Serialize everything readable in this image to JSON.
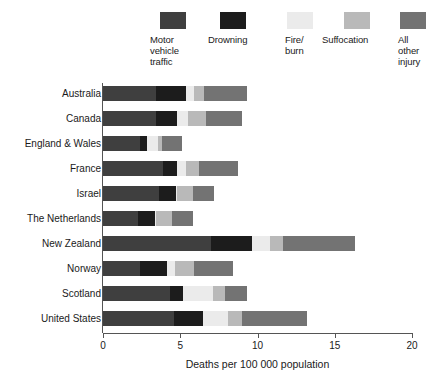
{
  "chart_data": {
    "type": "bar",
    "orientation": "horizontal",
    "stacked": true,
    "title": "",
    "xlabel": "Deaths per 100 000 population",
    "ylabel": "",
    "xlim": [
      0,
      20
    ],
    "xticks": [
      0,
      5,
      10,
      15,
      20
    ],
    "xtick_labels": [
      "0",
      "5",
      "10",
      "15",
      "20"
    ],
    "grid": false,
    "legend_position": "top",
    "categories": [
      "Australia",
      "Canada",
      "England & Wales",
      "France",
      "Israel",
      "The Netherlands",
      "New Zealand",
      "Norway",
      "Scotland",
      "United States"
    ],
    "series": [
      {
        "name": "Motor\nvehicle\ntraffic",
        "name_plain": "Motor vehicle traffic",
        "color": "#3f3f3f",
        "values": [
          3.4,
          3.4,
          2.4,
          3.9,
          3.6,
          2.25,
          7.0,
          2.4,
          4.35,
          4.6
        ]
      },
      {
        "name": "Drowning",
        "name_plain": "Drowning",
        "color": "#1c1c1c",
        "values": [
          2.0,
          1.4,
          0.45,
          0.9,
          1.1,
          1.1,
          2.65,
          1.75,
          0.85,
          1.9
        ]
      },
      {
        "name": "Fire/\nburn",
        "name_plain": "Fire/burn",
        "color": "#ebebeb",
        "values": [
          0.5,
          0.7,
          0.7,
          0.55,
          0.1,
          0.1,
          1.15,
          0.5,
          1.95,
          1.6
        ]
      },
      {
        "name": "Suffocation",
        "name_plain": "Suffocation",
        "color": "#b9b9b9",
        "values": [
          0.65,
          1.2,
          0.3,
          0.85,
          1.0,
          1.0,
          0.85,
          1.25,
          0.75,
          0.9
        ]
      },
      {
        "name": "All\nother\ninjury",
        "name_plain": "All other injury",
        "color": "#737373",
        "values": [
          2.8,
          2.3,
          1.25,
          2.55,
          1.4,
          1.35,
          4.65,
          2.5,
          1.4,
          4.2
        ]
      }
    ],
    "totals": [
      9.35,
      9.0,
      5.1,
      8.75,
      7.2,
      5.8,
      16.3,
      8.4,
      9.3,
      13.2
    ]
  },
  "legend": {
    "items": [
      {
        "label": "Motor\nvehicle\ntraffic",
        "color": "#3f3f3f",
        "left": 0,
        "swatch_left": 10
      },
      {
        "label": "Drowning",
        "color": "#1c1c1c",
        "left": 58,
        "swatch_left": 12
      },
      {
        "label": "Fire/\nburn",
        "color": "#ebebeb",
        "left": 135,
        "swatch_left": 2
      },
      {
        "label": "Suffocation",
        "color": "#b9b9b9",
        "left": 172,
        "swatch_left": 22
      },
      {
        "label": "All\nother\ninjury",
        "color": "#737373",
        "left": 248,
        "swatch_left": 2
      }
    ]
  }
}
